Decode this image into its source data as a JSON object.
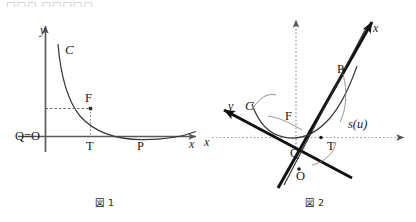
{
  "page": {
    "background": "#ffffff",
    "ink": "#1a1a1a",
    "faint_ink": "#8d8d8d",
    "top_cut_text": "□□□ □□□□□,"
  },
  "figure1": {
    "caption": "図 1",
    "axis_labels": {
      "y": "y",
      "x": "x"
    },
    "curve_label": "C",
    "points": [
      {
        "name": "origin",
        "label": "Q=O"
      },
      {
        "name": "focus",
        "label": "F"
      },
      {
        "name": "tangent-foot",
        "label": "T"
      },
      {
        "name": "point-p",
        "label": "P"
      }
    ],
    "guides": [
      "horizontal-dashed-to-F",
      "vertical-dotted-from-F-to-T"
    ],
    "description": "Catenary-like curve C in the first quadrant descending from upper left to a minimum and rising slightly; point F above the x-axis, T its projection on x-axis, P further right on the curve."
  },
  "figure2": {
    "caption": "図 2",
    "rotated_axis_labels": {
      "x": "x",
      "y": "y"
    },
    "reference_axis_labels": {
      "x": "x",
      "y": ""
    },
    "curve_label": "C",
    "arc_label": "s(u)",
    "points": [
      {
        "name": "point-p",
        "label": "P"
      },
      {
        "name": "focus",
        "label": "F"
      },
      {
        "name": "tangent-foot",
        "label": "T"
      },
      {
        "name": "point-q",
        "label": "Q"
      },
      {
        "name": "origin",
        "label": "O"
      }
    ],
    "description": "The same configuration rotated: heavy rotated x-axis points to the upper right and heavy rotated y-axis points to the upper left, crossing at O; faint dotted horizontal and vertical reference axes; curve C is a U-shaped catenary with F, T, Q marked and arc length s(u) from T up to P."
  }
}
